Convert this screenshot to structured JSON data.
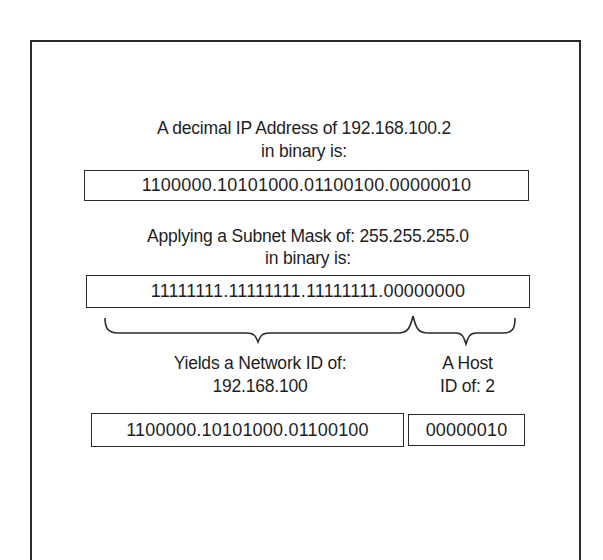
{
  "diagram": {
    "ip_section": {
      "heading_line1": "A decimal IP Address of 192.168.100.2",
      "heading_line2": "in binary is:",
      "binary_value": "1100000.10101000.01100100.00000010"
    },
    "mask_section": {
      "heading_line1": "Applying a Subnet Mask of: 255.255.255.0",
      "heading_line2": "in binary is:",
      "binary_value": "11111111.11111111.11111111.00000000"
    },
    "result_section": {
      "network": {
        "label_line1": "Yields a Network ID of:",
        "label_line2": "192.168.100",
        "binary_value": "1100000.10101000.01100100"
      },
      "host": {
        "label_line1": "A Host",
        "label_line2": "ID of: 2",
        "binary_value": "00000010"
      }
    },
    "braces": [
      {
        "name": "network-portion-brace",
        "spans": "first three octets"
      },
      {
        "name": "host-portion-brace",
        "spans": "last octet"
      }
    ]
  }
}
